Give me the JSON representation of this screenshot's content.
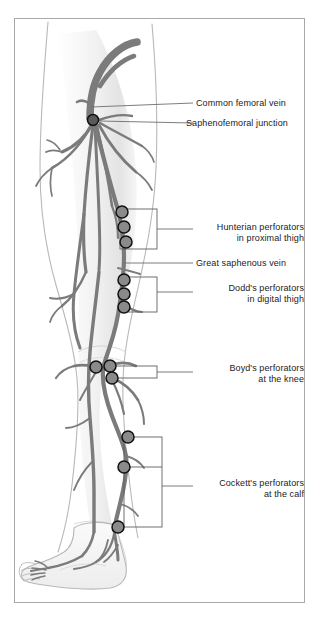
{
  "figure": {
    "border_color": "#a9a9a9",
    "vein_color": "#7b7b7b",
    "outline_color": "#b4b4b4",
    "marker_color": "#1a1a1a",
    "leader_color": "#6e6e6e",
    "text_color": "#1b1b1b",
    "background": "#ffffff"
  },
  "labels": [
    {
      "id": "common-femoral-vein",
      "text": "Common femoral vein",
      "align": "left",
      "x": 196,
      "y": 98,
      "leader_from_x": 91,
      "leader_from_y": 107,
      "leader_to_x": 193,
      "leader_to_y": 103
    },
    {
      "id": "saphenofemoral-junction",
      "text": "Saphenofemoral junction",
      "align": "left",
      "x": 186,
      "y": 118,
      "leader_from_x": 97,
      "leader_from_y": 121,
      "leader_to_x": 183,
      "leader_to_y": 123
    },
    {
      "id": "hunterian-perforators",
      "line1": "Hunterian perforators",
      "line2": "in proximal thigh",
      "align": "right",
      "x": 196,
      "y": 222,
      "leader_from_x": 157,
      "leader_from_y": 229,
      "leader_to_x": 193,
      "leader_to_y": 229
    },
    {
      "id": "great-saphenous-vein",
      "text": "Great saphenous vein",
      "align": "left",
      "x": 196,
      "y": 258,
      "leader_from_x": 124,
      "leader_from_y": 263,
      "leader_to_x": 193,
      "leader_to_y": 263
    },
    {
      "id": "dodds-perforators",
      "line1": "Dodd's perforators",
      "line2": "in digital thigh",
      "align": "right",
      "x": 196,
      "y": 283,
      "leader_from_x": 157,
      "leader_from_y": 292,
      "leader_to_x": 193,
      "leader_to_y": 292
    },
    {
      "id": "boyds-perforators",
      "line1": "Boyd's perforators",
      "line2": "at the knee",
      "align": "right",
      "x": 196,
      "y": 363,
      "leader_from_x": 157,
      "leader_from_y": 372,
      "leader_to_x": 193,
      "leader_to_y": 372
    },
    {
      "id": "cocketts-perforators",
      "line1": "Cockett's perforators",
      "line2": "at the calf",
      "align": "right",
      "x": 196,
      "y": 478,
      "leader_from_x": 162,
      "leader_from_y": 486,
      "leader_to_x": 193,
      "leader_to_y": 486
    }
  ],
  "perforator_groups": [
    {
      "id": "hunterian",
      "label_ref": "hunterian-perforators",
      "bracket": {
        "x": 120,
        "y": 209,
        "width": 37,
        "height": 40
      },
      "markers": [
        {
          "cx": 122,
          "cy": 212,
          "r": 6
        },
        {
          "cx": 124,
          "cy": 227,
          "r": 6
        },
        {
          "cx": 126,
          "cy": 242,
          "r": 6
        }
      ]
    },
    {
      "id": "dodds",
      "label_ref": "dodds-perforators",
      "bracket": {
        "x": 122,
        "y": 277,
        "width": 35,
        "height": 35
      },
      "markers": [
        {
          "cx": 124,
          "cy": 280,
          "r": 6
        },
        {
          "cx": 124,
          "cy": 294,
          "r": 6
        },
        {
          "cx": 124,
          "cy": 307,
          "r": 6
        }
      ]
    },
    {
      "id": "boyds",
      "label_ref": "boyds-perforators",
      "bracket": {
        "x": 113,
        "y": 366,
        "width": 44,
        "height": 12
      },
      "markers": [
        {
          "cx": 96,
          "cy": 367,
          "r": 6
        },
        {
          "cx": 110,
          "cy": 366,
          "r": 6
        },
        {
          "cx": 112,
          "cy": 378,
          "r": 6
        }
      ]
    },
    {
      "id": "cocketts",
      "label_ref": "cocketts-perforators",
      "bracket": {
        "x": 124,
        "y": 437,
        "width": 38,
        "height": 90
      },
      "markers": [
        {
          "cx": 128,
          "cy": 437,
          "r": 6
        },
        {
          "cx": 124,
          "cy": 467,
          "r": 6
        },
        {
          "cx": 118,
          "cy": 527,
          "r": 6
        }
      ]
    }
  ],
  "single_markers": [
    {
      "id": "saphenofemoral-junction-marker",
      "cx": 93,
      "cy": 120,
      "r": 6
    }
  ],
  "counts": {
    "hunterian_perforators": 3,
    "dodds_perforators": 3,
    "boyds_perforators": 3,
    "cocketts_perforators": 3
  }
}
